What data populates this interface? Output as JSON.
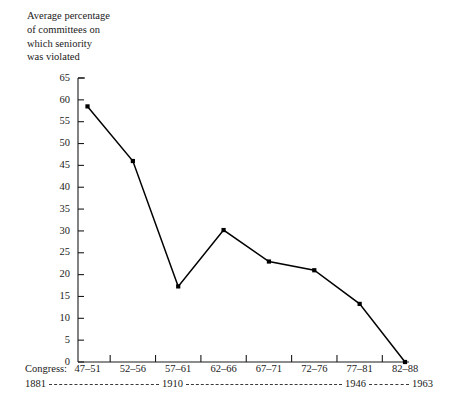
{
  "title": {
    "text": "Average percentage\nof committees on\nwhich seniority\nwas violated"
  },
  "axis": {
    "congress_prefix": "Congress:",
    "y_ticks": [
      "0",
      "5",
      "10",
      "15",
      "20",
      "25",
      "30",
      "35",
      "40",
      "45",
      "50",
      "55",
      "60",
      "65"
    ],
    "year_labels": [
      "1881",
      "1910",
      "1946",
      "1963"
    ]
  },
  "chart_data": {
    "type": "line",
    "title": "Average percentage of committees on which seniority was violated",
    "xlabel": "Congress:",
    "ylabel": "Average percentage of committees on which seniority was violated",
    "categories": [
      "47–51",
      "52–56",
      "57–61",
      "62–66",
      "67–71",
      "72–76",
      "77–81",
      "82–88"
    ],
    "values": [
      58.5,
      46.0,
      17.3,
      30.2,
      23.0,
      21.0,
      13.3,
      0.0
    ],
    "ylim": [
      0,
      65
    ],
    "y_ticks": [
      0,
      5,
      10,
      15,
      20,
      25,
      30,
      35,
      40,
      45,
      50,
      55,
      60,
      65
    ],
    "grid": false,
    "legend": "none",
    "marker": "filled-square",
    "line_color": "#000000",
    "marker_color": "#000000",
    "background_color": "#ffffff",
    "year_axis": {
      "labels": [
        "1881",
        "1910",
        "1946",
        "1963"
      ],
      "connector": "dashed"
    },
    "annotations": []
  }
}
